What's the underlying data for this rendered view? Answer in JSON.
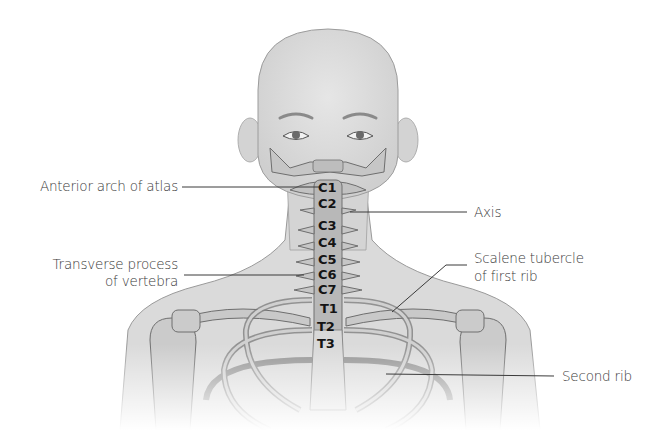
{
  "diagram": {
    "colors": {
      "background": "#ffffff",
      "skin": "#d9d9d9",
      "bone": "#c4c4c4",
      "bone_outline": "#7a7a7a",
      "leader_line": "#3a3a3a",
      "label_text": "#3a3a3a",
      "vertebra_text": "#141414"
    },
    "labels": {
      "anterior_arch": "Anterior arch of atlas",
      "transverse_line1": "Transverse process",
      "transverse_line2": "of vertebra",
      "axis": "Axis",
      "scalene_line1": "Scalene tubercle",
      "scalene_line2": "of first rib",
      "second_rib": "Second rib"
    },
    "vertebrae": [
      "C1",
      "C2",
      "C3",
      "C4",
      "C5",
      "C6",
      "C7",
      "T1",
      "T2",
      "T3"
    ]
  }
}
